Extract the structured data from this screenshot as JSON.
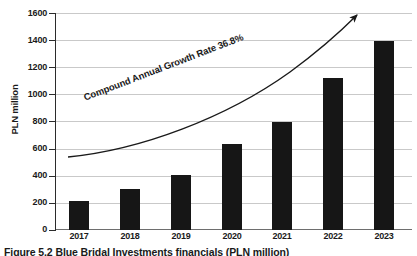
{
  "chart_data": {
    "type": "bar",
    "title": "",
    "subtitle": "",
    "xlabel": "",
    "ylabel": "PLN million",
    "categories": [
      "2017",
      "2018",
      "2019",
      "2020",
      "2021",
      "2022",
      "2023"
    ],
    "values": [
      215,
      305,
      410,
      640,
      800,
      1125,
      1400
    ],
    "series": [
      {
        "name": "Revenue",
        "values": [
          215,
          305,
          410,
          640,
          800,
          1125,
          1400
        ]
      }
    ],
    "ylim": [
      0,
      1600
    ],
    "ytick_step": 200,
    "ytick_labels": [
      "0",
      "200",
      "400",
      "600",
      "800",
      "1000",
      "1200",
      "1400",
      "1600"
    ],
    "ytick_values": [
      0,
      200,
      400,
      600,
      800,
      1000,
      1200,
      1400,
      1600
    ],
    "grid": "horizontal",
    "legend": "none",
    "bar_color": "#161616",
    "gridline_color": "#c9c9c9",
    "axis_color": "#2b2b2b",
    "background_color": "#ffffff",
    "annotations": [
      {
        "name": "cagr-arrow",
        "text": "Compound Annual Growth Rate 36.8%",
        "value": "36.8%",
        "shape": "curved-arrow-up-right"
      }
    ]
  },
  "figure": {
    "caption": "Figure 5.2  Blue Bridal Investments financials (PLN million)"
  }
}
